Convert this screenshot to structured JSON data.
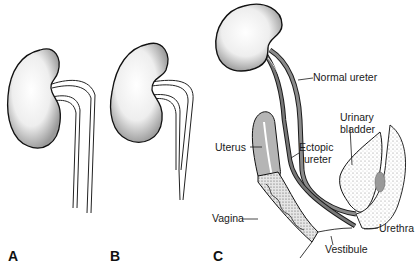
{
  "figure": {
    "panels": [
      {
        "id": "A",
        "label": "A"
      },
      {
        "id": "B",
        "label": "B"
      },
      {
        "id": "C",
        "label": "C"
      }
    ],
    "annotations": {
      "normal_ureter": "Normal ureter",
      "urinary_bladder_1": "Urinary",
      "urinary_bladder_2": "bladder",
      "uterus": "Uterus",
      "ectopic_ureter_1": "Ectopic",
      "ectopic_ureter_2": "ureter",
      "vagina": "Vagina",
      "urethra": "Urethra",
      "vestibule": "Vestibule"
    },
    "colors": {
      "line": "#1a1a1a",
      "ureter_fill": "#8a8a8a",
      "uterus_fill": "#b5b5b5",
      "kidney_fill": "#f4f4f4"
    }
  }
}
